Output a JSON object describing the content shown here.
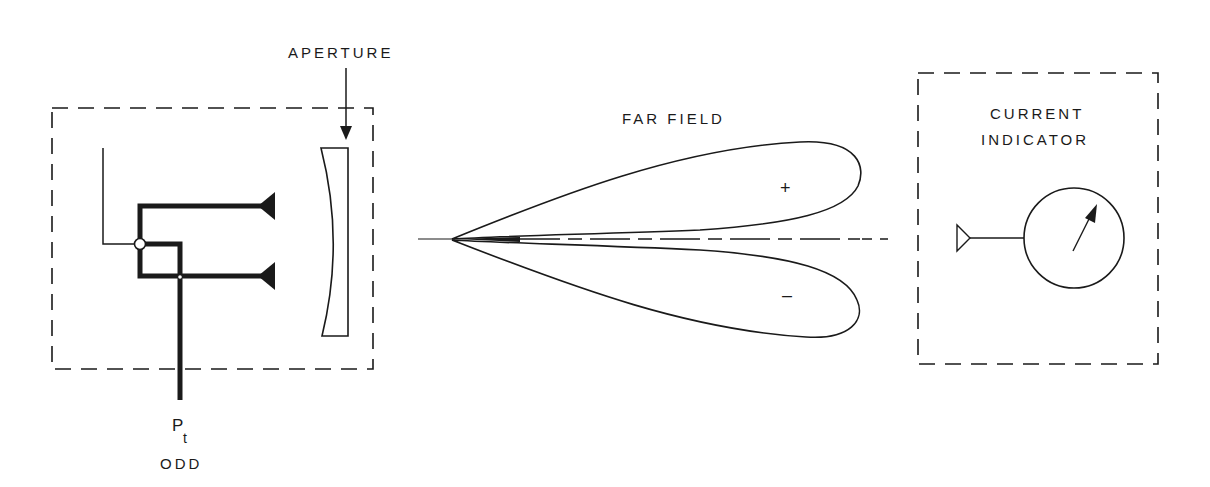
{
  "diagram": {
    "transmitter": {
      "aperture_label": "APERTURE",
      "power_label": "P",
      "power_subscript": "t",
      "mode_label": "ODD"
    },
    "far_field": {
      "title": "FAR FIELD",
      "upper_lobe_sign": "+",
      "lower_lobe_sign": "–"
    },
    "receiver": {
      "title_line1": "CURRENT",
      "title_line2": "INDICATOR"
    },
    "colors": {
      "ink": "#1a1a1a",
      "background": "#ffffff"
    }
  }
}
